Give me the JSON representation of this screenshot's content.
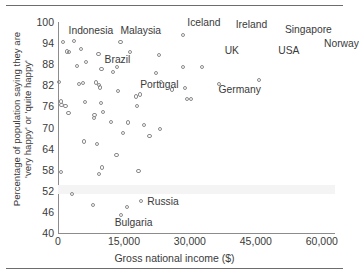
{
  "figure": {
    "rule_top": "",
    "rule_bottom": ""
  },
  "chart_data": {
    "type": "scatter",
    "title": "",
    "xlabel": "Gross national income ($)",
    "ylabel": "Percentage of population saying they are\n'very happy' or 'quite happy'",
    "xlim": [
      0,
      63000
    ],
    "ylim": [
      40,
      100
    ],
    "xticks": [
      "0",
      "15,000",
      "30,000",
      "45,000",
      "60,000"
    ],
    "xtick_values": [
      0,
      15000,
      30000,
      45000,
      60000
    ],
    "yticks": [
      "40",
      "46",
      "52",
      "58",
      "64",
      "70",
      "76",
      "82",
      "88",
      "94",
      "100"
    ],
    "ytick_values": [
      40,
      46,
      52,
      58,
      64,
      70,
      76,
      82,
      88,
      94,
      100
    ],
    "grid": false,
    "legend": null,
    "annotations": [
      {
        "label": "Indonesia",
        "x": 2400,
        "y": 97.2
      },
      {
        "label": "Malaysia",
        "x": 14200,
        "y": 97.2
      },
      {
        "label": "Iceland",
        "x": 29400,
        "y": 99.4
      },
      {
        "label": "Ireland",
        "x": 40400,
        "y": 98.8
      },
      {
        "label": "Singapore",
        "x": 51600,
        "y": 97.4
      },
      {
        "label": "Norway",
        "x": 60500,
        "y": 93.6
      },
      {
        "label": "UK",
        "x": 37900,
        "y": 91.6
      },
      {
        "label": "USA",
        "x": 50100,
        "y": 91.4
      },
      {
        "label": "Brazil",
        "x": 10600,
        "y": 88.8
      },
      {
        "label": "Portugal",
        "x": 18700,
        "y": 81.8
      },
      {
        "label": "Germany",
        "x": 36500,
        "y": 80.4
      },
      {
        "label": "Russia",
        "x": 20300,
        "y": 48.4
      },
      {
        "label": "Bulgaria",
        "x": 12900,
        "y": 42.6
      }
    ],
    "points": [
      {
        "x": 1200,
        "y": 94.4
      },
      {
        "x": 3600,
        "y": 94.6
      },
      {
        "x": 2000,
        "y": 91.6
      },
      {
        "x": 2500,
        "y": 91.4
      },
      {
        "x": 5200,
        "y": 92.4
      },
      {
        "x": 9200,
        "y": 91.0
      },
      {
        "x": 14200,
        "y": 94.2
      },
      {
        "x": 16300,
        "y": 91.4
      },
      {
        "x": 23000,
        "y": 90.6
      },
      {
        "x": 28400,
        "y": 96.4
      },
      {
        "x": 4400,
        "y": 87.6
      },
      {
        "x": 6400,
        "y": 88.6
      },
      {
        "x": 9900,
        "y": 86.6
      },
      {
        "x": 13500,
        "y": 87.2
      },
      {
        "x": 12500,
        "y": 85.8
      },
      {
        "x": 22300,
        "y": 85.4
      },
      {
        "x": 28500,
        "y": 87.2
      },
      {
        "x": 32800,
        "y": 87.2
      },
      {
        "x": 300,
        "y": 83.0
      },
      {
        "x": 4700,
        "y": 82.4
      },
      {
        "x": 5700,
        "y": 82.6
      },
      {
        "x": 8600,
        "y": 82.8
      },
      {
        "x": 9300,
        "y": 82.2
      },
      {
        "x": 9500,
        "y": 81.4
      },
      {
        "x": 13700,
        "y": 80.4
      },
      {
        "x": 23400,
        "y": 83.0
      },
      {
        "x": 25900,
        "y": 80.8
      },
      {
        "x": 28900,
        "y": 81.2
      },
      {
        "x": 36600,
        "y": 82.4
      },
      {
        "x": 45700,
        "y": 83.6
      },
      {
        "x": 700,
        "y": 77.4
      },
      {
        "x": 800,
        "y": 76.4
      },
      {
        "x": 1700,
        "y": 76.2
      },
      {
        "x": 2400,
        "y": 74.2
      },
      {
        "x": 6100,
        "y": 77.2
      },
      {
        "x": 9700,
        "y": 77.0
      },
      {
        "x": 8300,
        "y": 73.6
      },
      {
        "x": 10200,
        "y": 74.4
      },
      {
        "x": 17800,
        "y": 78.8
      },
      {
        "x": 18600,
        "y": 79.4
      },
      {
        "x": 17900,
        "y": 76.2
      },
      {
        "x": 29300,
        "y": 78.2
      },
      {
        "x": 30300,
        "y": 78.2
      },
      {
        "x": 8200,
        "y": 72.6
      },
      {
        "x": 12100,
        "y": 71.6
      },
      {
        "x": 15900,
        "y": 71.4
      },
      {
        "x": 19500,
        "y": 70.8
      },
      {
        "x": 14700,
        "y": 68.4
      },
      {
        "x": 20800,
        "y": 67.6
      },
      {
        "x": 23200,
        "y": 69.6
      },
      {
        "x": 5900,
        "y": 66.0
      },
      {
        "x": 8900,
        "y": 65.4
      },
      {
        "x": 13300,
        "y": 62.2
      },
      {
        "x": 10000,
        "y": 58.6
      },
      {
        "x": 9400,
        "y": 56.8
      },
      {
        "x": 700,
        "y": 57.4
      },
      {
        "x": 18300,
        "y": 57.6
      },
      {
        "x": 3100,
        "y": 51.0
      },
      {
        "x": 8000,
        "y": 48.0
      },
      {
        "x": 15700,
        "y": 47.4
      },
      {
        "x": 18900,
        "y": 49.2
      },
      {
        "x": 14400,
        "y": 45.2
      }
    ]
  }
}
